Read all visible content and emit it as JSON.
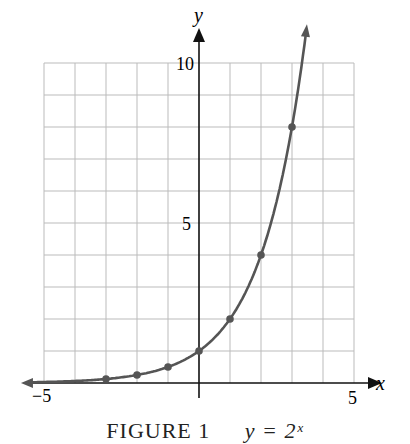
{
  "chart_data": {
    "type": "line",
    "title": "",
    "function": "y = 2^x",
    "xlabel": "x",
    "ylabel": "y",
    "xlim": [
      -5,
      5
    ],
    "ylim": [
      0,
      10
    ],
    "grid": true,
    "x_tick_labels": [
      "-5",
      "5"
    ],
    "y_tick_labels": [
      "5",
      "10"
    ],
    "points": [
      {
        "x": -3,
        "y": 0.125
      },
      {
        "x": -2,
        "y": 0.25
      },
      {
        "x": -1,
        "y": 0.5
      },
      {
        "x": 0,
        "y": 1
      },
      {
        "x": 1,
        "y": 2
      },
      {
        "x": 2,
        "y": 4
      },
      {
        "x": 3,
        "y": 8
      }
    ],
    "curve_color": "#555555",
    "grid_color": "#bbbbbb",
    "axis_color": "#111111"
  },
  "labels": {
    "x_axis": "x",
    "y_axis": "y",
    "x_min": "−5",
    "x_max": "5",
    "y_mid": "5",
    "y_max": "10"
  },
  "caption": {
    "figure": "FIGURE 1",
    "function": "y = 2ˣ"
  }
}
